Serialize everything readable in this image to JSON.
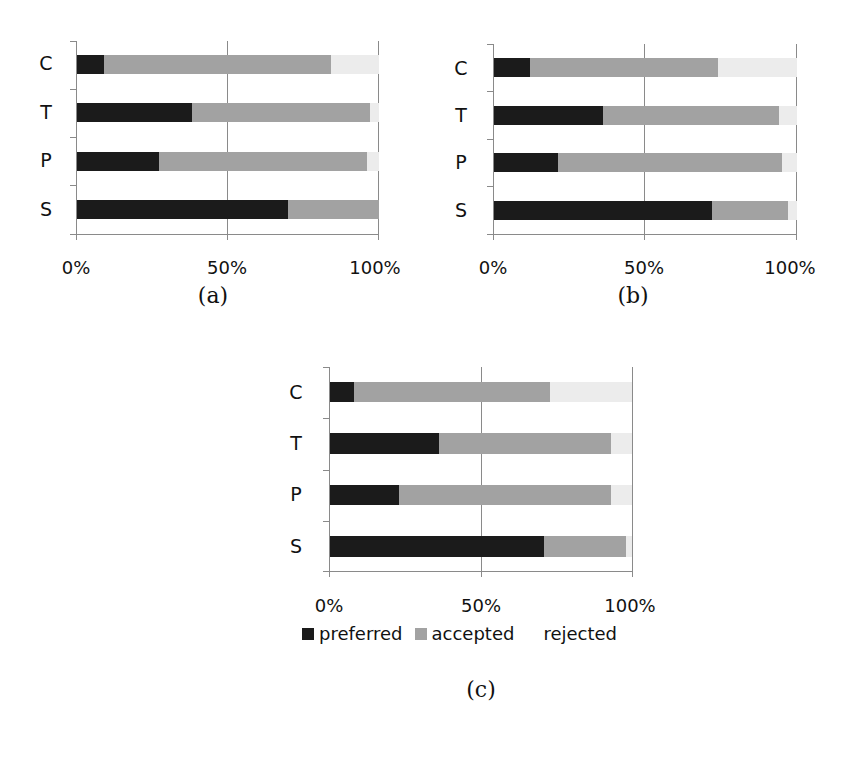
{
  "figure": {
    "legend": [
      {
        "label": "preferred",
        "color": "#1b1b1b"
      },
      {
        "label": "accepted",
        "color": "#a2a2a2"
      },
      {
        "label": "rejected",
        "color": "#ececec"
      }
    ],
    "x_ticks": [
      "0%",
      "50%",
      "100%"
    ]
  },
  "chart_data": [
    {
      "type": "bar",
      "orientation": "horizontal",
      "stacked": "percent",
      "caption": "(a)",
      "categories": [
        "C",
        "T",
        "P",
        "S"
      ],
      "series": [
        {
          "name": "preferred",
          "values": [
            9,
            38,
            27,
            70
          ]
        },
        {
          "name": "accepted",
          "values": [
            75,
            59,
            69,
            30
          ]
        },
        {
          "name": "rejected",
          "values": [
            16,
            3,
            4,
            0
          ]
        }
      ],
      "xlabel": "",
      "ylabel": "",
      "xlim": [
        0,
        100
      ],
      "x_tick_labels": [
        "0%",
        "50%",
        "100%"
      ],
      "grid": "vertical at 50% and 100%",
      "legend_position": "none (shared legend under (c))"
    },
    {
      "type": "bar",
      "orientation": "horizontal",
      "stacked": "percent",
      "caption": "(b)",
      "categories": [
        "C",
        "T",
        "P",
        "S"
      ],
      "series": [
        {
          "name": "preferred",
          "values": [
            12,
            36,
            21,
            72
          ]
        },
        {
          "name": "accepted",
          "values": [
            62,
            58,
            74,
            25
          ]
        },
        {
          "name": "rejected",
          "values": [
            26,
            6,
            5,
            3
          ]
        }
      ],
      "xlabel": "",
      "ylabel": "",
      "xlim": [
        0,
        100
      ],
      "x_tick_labels": [
        "0%",
        "50%",
        "100%"
      ],
      "grid": "vertical at 50% and 100%",
      "legend_position": "none (shared legend under (c))"
    },
    {
      "type": "bar",
      "orientation": "horizontal",
      "stacked": "percent",
      "caption": "(c)",
      "categories": [
        "C",
        "T",
        "P",
        "S"
      ],
      "series": [
        {
          "name": "preferred",
          "values": [
            8,
            36,
            23,
            71
          ]
        },
        {
          "name": "accepted",
          "values": [
            65,
            57,
            70,
            27
          ]
        },
        {
          "name": "rejected",
          "values": [
            27,
            7,
            7,
            2
          ]
        }
      ],
      "xlabel": "",
      "ylabel": "",
      "xlim": [
        0,
        100
      ],
      "x_tick_labels": [
        "0%",
        "50%",
        "100%"
      ],
      "grid": "vertical at 50% and 100%",
      "legend_position": "bottom",
      "legend": [
        "preferred",
        "accepted",
        "rejected"
      ]
    }
  ]
}
